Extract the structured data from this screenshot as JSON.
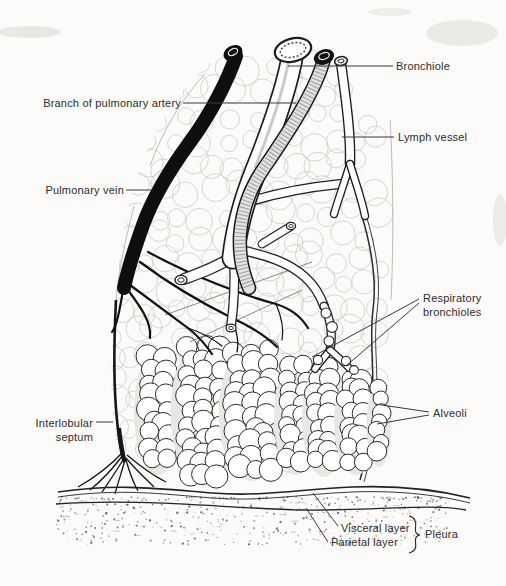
{
  "figure": {
    "ink_color": "#1c1c1c",
    "paper_color": "#fcfbf9"
  },
  "labels": {
    "bronchiole": "Bronchiole",
    "branch_pulmonary_artery": "Branch of pulmonary artery",
    "lymph_vessel": "Lymph vessel",
    "pulmonary_vein": "Pulmonary vein",
    "respiratory_bronchioles": "Respiratory bronchioles",
    "alveoli": "Alveoli",
    "interlobular_septum": "Interlobular septum",
    "visceral_layer": "Visceral layer",
    "parietal_layer": "Parietal layer",
    "pleura": "Pleura"
  }
}
